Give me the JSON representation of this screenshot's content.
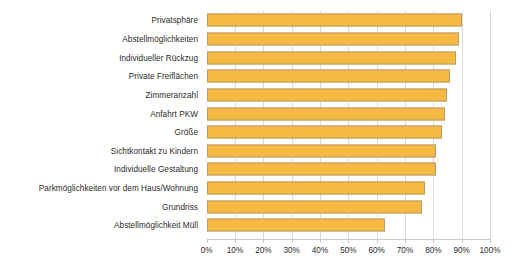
{
  "chart_data": {
    "type": "bar",
    "orientation": "horizontal",
    "title": "",
    "subtitle": "",
    "xlabel": "",
    "ylabel": "",
    "xlim": [
      0,
      100
    ],
    "grid": true,
    "legend": null,
    "legend_position": "none",
    "unit": "%",
    "accent_color": "#f6b944",
    "bar_border_color": "#b99a6a",
    "gridline_color": "#d9d9d9",
    "text_color": "#2b2b2b",
    "categories": [
      "Privatsphäre",
      "Abstellmöglichkeiten",
      "Individueller Rückzug",
      "Private Freiflächen",
      "Zimmeranzahl",
      "Anfahrt PKW",
      "Größe",
      "Sichtkontakt zu Kindern",
      "Individuelle Gestaltung",
      "Parkmöglichkeiten vor dem Haus/Wohnung",
      "Grundriss",
      "Abstellmöglichkeit Müll"
    ],
    "values": [
      90,
      89,
      88,
      86,
      85,
      84,
      83,
      81,
      81,
      77,
      76,
      63
    ],
    "xticks": [
      0,
      10,
      20,
      30,
      40,
      50,
      60,
      70,
      80,
      90,
      100
    ],
    "xticklabels": [
      "0%",
      "10%",
      "20%",
      "30%",
      "40%",
      "50%",
      "60%",
      "70%",
      "80%",
      "90%",
      "100%"
    ]
  }
}
